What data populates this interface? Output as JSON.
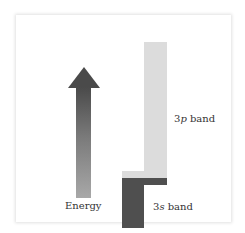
{
  "diagram": {
    "type": "energy-band-diagram",
    "arrow": {
      "label": "Energy",
      "direction": "up",
      "colors": {
        "top": "#4a4a4a",
        "bottom": "#a8a8a8"
      }
    },
    "bands": [
      {
        "name": "3p band",
        "prefix": "3",
        "orbital": "p",
        "suffix": " band",
        "color": "#dcdcdc"
      },
      {
        "name": "3s band",
        "prefix": "3",
        "orbital": "s",
        "suffix": " band",
        "color": "#4f4f4f"
      }
    ]
  }
}
